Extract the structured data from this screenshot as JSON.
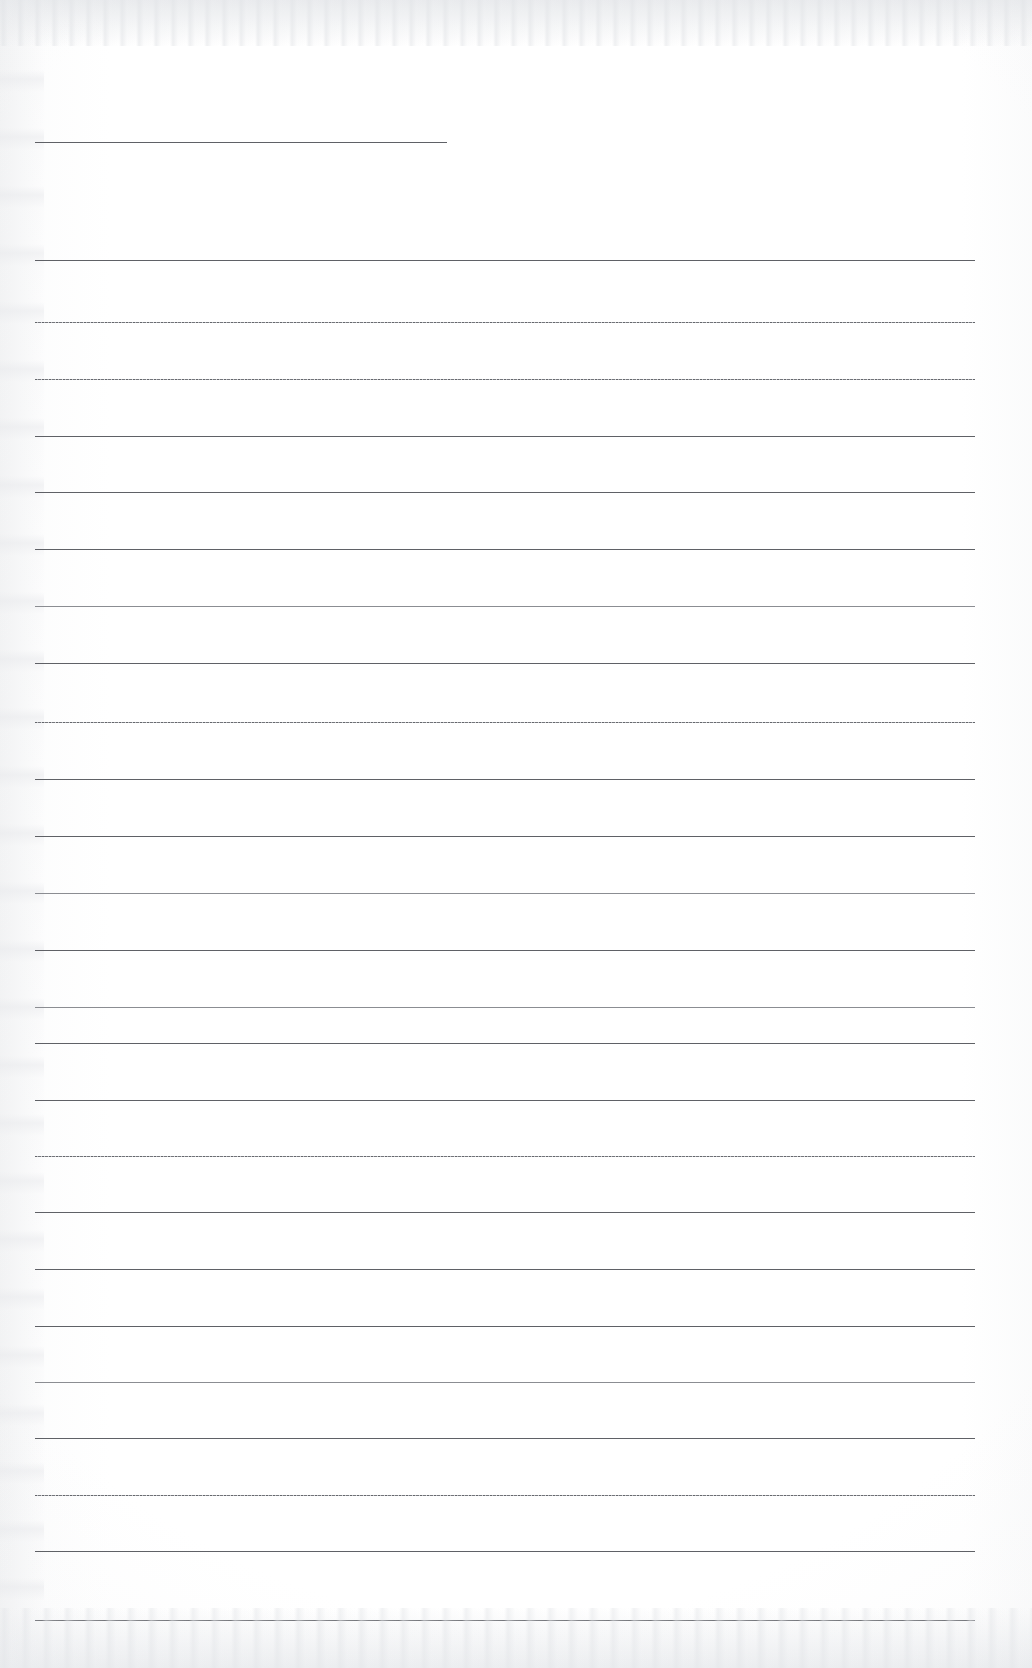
{
  "document": {
    "kind": "scanned-lined-paper",
    "title": "Blank ruled notebook page (scan)",
    "page_width": 1032,
    "page_height": 1668,
    "background_color": "#ffffff",
    "paper_tint_color": "#f2f3f5",
    "rule_color": "#5f6166",
    "rule_color_light": "#8b8d92",
    "text_content": "",
    "margin_left": 35,
    "margin_right": 975,
    "line_spacing": 56.7,
    "rule_count": 25,
    "notes": "Page is empty — no handwriting, no printed text, no header or page number visible."
  },
  "rules": [
    {
      "id": "rule-header-short",
      "y": 142,
      "x1": 35,
      "x2": 447,
      "weight": "heavy",
      "style": "solid"
    },
    {
      "id": "rule-01",
      "y": 260,
      "x1": 35,
      "x2": 975,
      "weight": "heavy",
      "style": "solid"
    },
    {
      "id": "rule-02",
      "y": 322,
      "x1": 35,
      "x2": 975,
      "weight": "normal",
      "style": "stippled"
    },
    {
      "id": "rule-03",
      "y": 378.5,
      "x1": 35,
      "x2": 975,
      "weight": "normal",
      "style": "stippled"
    },
    {
      "id": "rule-04",
      "y": 435.5,
      "x1": 35,
      "x2": 975,
      "weight": "heavy",
      "style": "solid"
    },
    {
      "id": "rule-05",
      "y": 492,
      "x1": 35,
      "x2": 975,
      "weight": "heavy",
      "style": "solid"
    },
    {
      "id": "rule-06",
      "y": 549,
      "x1": 35,
      "x2": 975,
      "weight": "heavy",
      "style": "solid"
    },
    {
      "id": "rule-07",
      "y": 606,
      "x1": 35,
      "x2": 975,
      "weight": "normal",
      "style": "solid"
    },
    {
      "id": "rule-08",
      "y": 662.5,
      "x1": 35,
      "x2": 975,
      "weight": "heavy",
      "style": "solid"
    },
    {
      "id": "rule-09",
      "y": 722,
      "x1": 35,
      "x2": 975,
      "weight": "normal",
      "style": "stippled"
    },
    {
      "id": "rule-10",
      "y": 779,
      "x1": 35,
      "x2": 975,
      "weight": "heavy",
      "style": "solid"
    },
    {
      "id": "rule-11",
      "y": 836,
      "x1": 35,
      "x2": 975,
      "weight": "heavy",
      "style": "solid"
    },
    {
      "id": "rule-12",
      "y": 893,
      "x1": 35,
      "x2": 975,
      "weight": "normal",
      "style": "solid"
    },
    {
      "id": "rule-13",
      "y": 950,
      "x1": 35,
      "x2": 975,
      "weight": "heavy",
      "style": "solid"
    },
    {
      "id": "rule-14",
      "y": 1006.5,
      "x1": 35,
      "x2": 975,
      "weight": "normal",
      "style": "solid"
    },
    {
      "id": "rule-15",
      "y": 1043,
      "x1": 35,
      "x2": 975,
      "weight": "heavy",
      "style": "solid"
    },
    {
      "id": "rule-16",
      "y": 1100,
      "x1": 35,
      "x2": 975,
      "weight": "heavy",
      "style": "solid"
    },
    {
      "id": "rule-17",
      "y": 1156,
      "x1": 35,
      "x2": 975,
      "weight": "normal",
      "style": "stippled"
    },
    {
      "id": "rule-18",
      "y": 1212,
      "x1": 35,
      "x2": 975,
      "weight": "heavy",
      "style": "solid"
    },
    {
      "id": "rule-19",
      "y": 1268.5,
      "x1": 35,
      "x2": 975,
      "weight": "heavy",
      "style": "solid"
    },
    {
      "id": "rule-20",
      "y": 1326,
      "x1": 35,
      "x2": 975,
      "weight": "heavy",
      "style": "solid"
    },
    {
      "id": "rule-21",
      "y": 1382,
      "x1": 35,
      "x2": 975,
      "weight": "normal",
      "style": "solid"
    },
    {
      "id": "rule-22",
      "y": 1438,
      "x1": 35,
      "x2": 975,
      "weight": "heavy",
      "style": "solid"
    },
    {
      "id": "rule-23",
      "y": 1495,
      "x1": 35,
      "x2": 975,
      "weight": "normal",
      "style": "stippled"
    },
    {
      "id": "rule-24",
      "y": 1551,
      "x1": 35,
      "x2": 975,
      "weight": "heavy",
      "style": "solid"
    },
    {
      "id": "rule-25",
      "y": 1620,
      "x1": 35,
      "x2": 975,
      "weight": "heavy",
      "style": "solid"
    }
  ]
}
